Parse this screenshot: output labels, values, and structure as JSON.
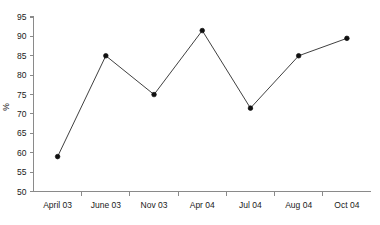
{
  "chart_data": {
    "type": "line",
    "title": "",
    "subtitle": "",
    "xlabel": "",
    "ylabel": "%",
    "categories": [
      "April 03",
      "June 03",
      "Nov 03",
      "Apr 04",
      "Jul 04",
      "Aug 04",
      "Oct 04"
    ],
    "values": [
      59,
      85,
      75,
      91.5,
      71.5,
      85,
      89.5
    ],
    "series": [
      {
        "name": "%",
        "values": [
          59,
          85,
          75,
          91.5,
          71.5,
          85,
          89.5
        ]
      }
    ],
    "ylim": [
      50,
      95
    ],
    "yticks": [
      50,
      55,
      60,
      65,
      70,
      75,
      80,
      85,
      90,
      95
    ],
    "ytick_labels": [
      "50",
      "55",
      "60",
      "65",
      "70",
      "75",
      "80",
      "85",
      "90",
      "95"
    ],
    "grid": false,
    "legend": false,
    "legend_position": "none",
    "marker": "filled-circle",
    "line_color": "#2a2a2a",
    "marker_color": "#101010",
    "axis_color": "#8a8a8a",
    "background_color": "#ffffff"
  }
}
